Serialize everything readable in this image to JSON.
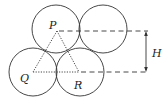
{
  "figure": {
    "title": "",
    "labels": {
      "P": "P",
      "Q": "Q",
      "R": "R",
      "H": "H"
    },
    "circles": [
      {
        "name": "circle-P",
        "cx": 56,
        "cy": 29,
        "r": 24
      },
      {
        "name": "circle-top-right",
        "cx": 103,
        "cy": 29,
        "r": 24
      },
      {
        "name": "circle-Q",
        "cx": 33,
        "cy": 72,
        "r": 24
      },
      {
        "name": "circle-R",
        "cx": 80,
        "cy": 72,
        "r": 24
      }
    ],
    "triangle": {
      "P": [
        57,
        31
      ],
      "Q": [
        33,
        72
      ],
      "R": [
        79,
        72
      ]
    },
    "dimension": {
      "label": "H",
      "top_y": 31,
      "bottom_y": 72,
      "x": 146
    },
    "colors": {
      "stroke": "#333333",
      "background": "#ffffff"
    }
  }
}
